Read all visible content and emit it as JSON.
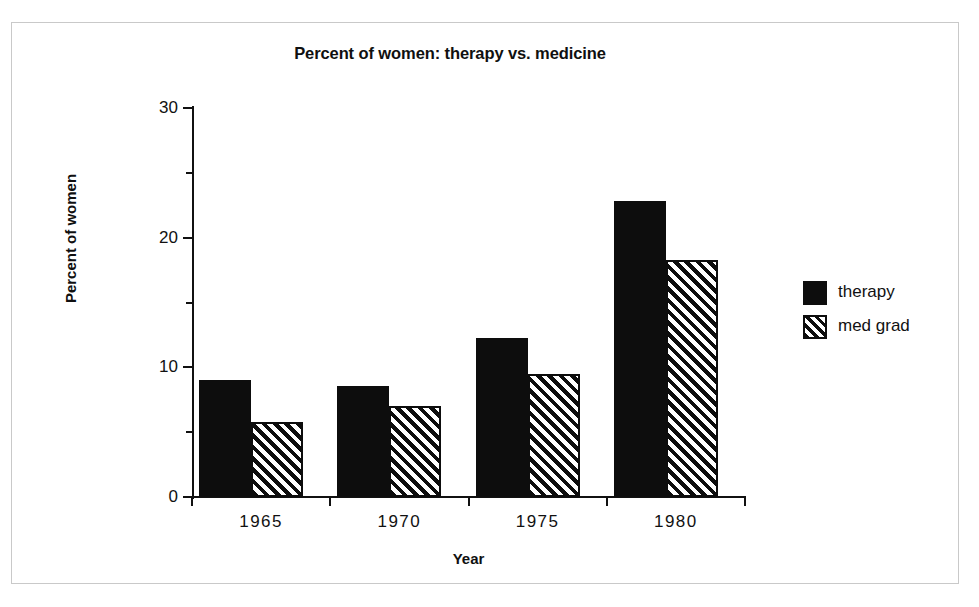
{
  "chart_data": {
    "type": "bar",
    "title": "Percent of women: therapy vs. medicine",
    "xlabel": "Year",
    "ylabel": "Percent of women",
    "categories": [
      "1965",
      "1970",
      "1975",
      "1980"
    ],
    "series": [
      {
        "name": "therapy",
        "values": [
          9.0,
          8.6,
          12.3,
          22.8
        ]
      },
      {
        "name": "med grad",
        "values": [
          5.8,
          7.0,
          9.5,
          18.3
        ]
      }
    ],
    "ylim": [
      0,
      30
    ],
    "y_ticks_major": [
      0,
      10,
      20,
      30
    ],
    "y_ticks_minor": [
      5,
      15,
      25
    ],
    "grid": false,
    "legend_position": "right",
    "legend": [
      {
        "label": "therapy",
        "swatch": "solid"
      },
      {
        "label": "med grad",
        "swatch": "hatch"
      }
    ],
    "colors": {
      "therapy": "#0d0d0d",
      "med_grad_outline": "#0d0d0d",
      "med_grad_fill": "#ffffff",
      "axis": "#111111",
      "frame": "#c9c9c9",
      "background": "#ffffff"
    }
  }
}
